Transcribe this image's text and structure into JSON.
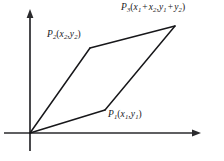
{
  "figure": {
    "background_color": "#ffffff",
    "stroke_color": "#1a1a1d",
    "axes": {
      "origin": [
        30,
        133
      ],
      "x_axis": {
        "name": "x-axis",
        "from": [
          30,
          133
        ],
        "to": [
          200,
          133
        ],
        "arrow": true
      },
      "y_axis": {
        "name": "y-axis",
        "from": [
          30,
          150
        ],
        "to": [
          30,
          10
        ],
        "arrow": true
      }
    },
    "vertices": {
      "origin": {
        "label": "O",
        "x": 30,
        "y": 133
      },
      "p1": {
        "x": 105,
        "y": 110
      },
      "p2": {
        "x": 90,
        "y": 48
      },
      "p3": {
        "x": 175,
        "y": 26
      }
    },
    "edges": [
      {
        "name": "origin-to-p1",
        "from": "origin",
        "to": "p1"
      },
      {
        "name": "p1-to-p3",
        "from": "p1",
        "to": "p3"
      },
      {
        "name": "origin-to-p2",
        "from": "origin",
        "to": "p2"
      },
      {
        "name": "p2-to-p3",
        "from": "p2",
        "to": "p3"
      }
    ],
    "labels": {
      "p1": {
        "point": "P",
        "point_sub": "1",
        "open": "(",
        "x_var": "x",
        "x_sub": "1",
        "comma": ",",
        "y_var": "y",
        "y_sub": "1",
        "close": ")",
        "text": "P1(x1, y1)"
      },
      "p2": {
        "point": "P",
        "point_sub": "2",
        "open": "(",
        "x_var": "x",
        "x_sub": "2",
        "comma": ",",
        "y_var": "y",
        "y_sub": "2",
        "close": ")",
        "text": "P2(x2, y2)"
      },
      "p3": {
        "point": "P",
        "point_sub": "3",
        "open": "(",
        "x_var_a": "x",
        "x_sub_a": "1",
        "plus_x": "+",
        "x_var_b": "x",
        "x_sub_b": "2",
        "comma": ",",
        "y_var_a": "y",
        "y_sub_a": "1",
        "plus_y": "+",
        "y_var_b": "y",
        "y_sub_b": "2",
        "close": ")",
        "text": "P3(x1 + x2, y1 + y2)"
      }
    }
  }
}
